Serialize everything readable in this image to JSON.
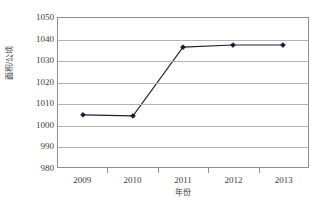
{
  "chart_data": {
    "type": "line",
    "title": "",
    "xlabel": "年份",
    "ylabel": "面积/公顷",
    "categories": [
      "2009",
      "2010",
      "2011",
      "2012",
      "2013"
    ],
    "values": [
      1004.5,
      1004.0,
      1036.3,
      1037.3,
      1037.3
    ],
    "series": [
      {
        "name": "面积",
        "values": [
          1004.5,
          1004.0,
          1036.3,
          1037.3,
          1037.3
        ]
      }
    ],
    "ylim": [
      980,
      1050
    ],
    "yticks": [
      1050,
      1040,
      1030,
      1020,
      1010,
      1000,
      990,
      980
    ],
    "ytick_labels": [
      "1050",
      "1040",
      "1030",
      "1020",
      "1010",
      "1000",
      "990",
      "980"
    ],
    "xtick_labels": [
      "2009",
      "2010",
      "2011",
      "2012",
      "2013"
    ],
    "grid": true,
    "grid_axis": "y",
    "legend": false,
    "legend_position": "none",
    "marker": "diamond",
    "colors": {
      "line": "#1f1f3d",
      "marker": "#151530",
      "gridline": "#b4b4b4",
      "frame": "#8d8d8d",
      "text": "#3c3c3c",
      "background": "#ffffff"
    }
  }
}
